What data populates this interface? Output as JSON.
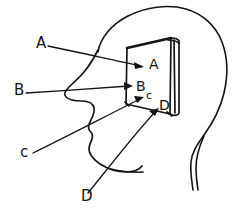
{
  "figure": {
    "type": "line-drawing",
    "background_color": "#ffffff",
    "ink_color": "#141414"
  },
  "labels": {
    "left_column": [
      {
        "id": "A",
        "text": "A",
        "x": 36,
        "y": 48
      },
      {
        "id": "B",
        "text": "B",
        "x": 14,
        "y": 95
      },
      {
        "id": "c",
        "text": "c",
        "x": 20,
        "y": 157
      }
    ],
    "bottom": [
      {
        "id": "D",
        "text": "D",
        "x": 81,
        "y": 201
      }
    ],
    "on_figure": [
      {
        "id": "A",
        "text": "A",
        "x": 151,
        "y": 68
      },
      {
        "id": "B",
        "text": "B",
        "x": 138,
        "y": 90
      },
      {
        "id": "c",
        "text": "c",
        "x": 148,
        "y": 99
      },
      {
        "id": "D",
        "text": "D",
        "x": 161,
        "y": 108
      }
    ]
  },
  "leaders": [
    {
      "id": "leader-A",
      "from_label": "A",
      "to": "plate-top-left-corner"
    },
    {
      "id": "leader-B",
      "from_label": "B",
      "to": "plate-left-edge-middle"
    },
    {
      "id": "leader-c",
      "from_label": "c",
      "to": "plate-lower-left-corner"
    },
    {
      "id": "leader-D",
      "from_label": "D",
      "to": "plate-lower-right-corner"
    }
  ],
  "parts": {
    "head_outline": "head-profile",
    "face_profile": "nose-lips-chin",
    "neck": "neck-line",
    "plate": "rectangular-slab"
  }
}
